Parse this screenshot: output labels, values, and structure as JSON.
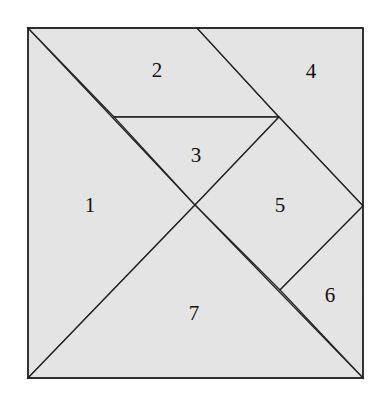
{
  "diagram": {
    "title": "",
    "square": {
      "x": 28,
      "y": 28,
      "width": 335,
      "height": 350
    },
    "fill_color": "#e4e4e4",
    "stroke_color": "#222222",
    "pieces": [
      {
        "id": "1",
        "label": "1",
        "points": "28,28 195,205 28,378",
        "label_pos": [
          90,
          212
        ]
      },
      {
        "id": "2",
        "label": "2",
        "points": "28,28 197,28 279,117 114,117",
        "label_pos": [
          157,
          77
        ]
      },
      {
        "id": "3",
        "label": "3",
        "points": "114,117 279,117 195,205",
        "label_pos": [
          196,
          162
        ]
      },
      {
        "id": "4",
        "label": "4",
        "points": "197,28 363,28 363,206 279,117",
        "label_pos": [
          311,
          78
        ]
      },
      {
        "id": "5",
        "label": "5",
        "points": "279,117 363,206 280,290 195,205",
        "label_pos": [
          280,
          212
        ]
      },
      {
        "id": "6",
        "label": "6",
        "points": "363,206 363,378 280,290",
        "label_pos": [
          330,
          302
        ]
      },
      {
        "id": "7",
        "label": "7",
        "points": "28,378 195,205 363,378",
        "label_pos": [
          194,
          320
        ]
      }
    ]
  }
}
